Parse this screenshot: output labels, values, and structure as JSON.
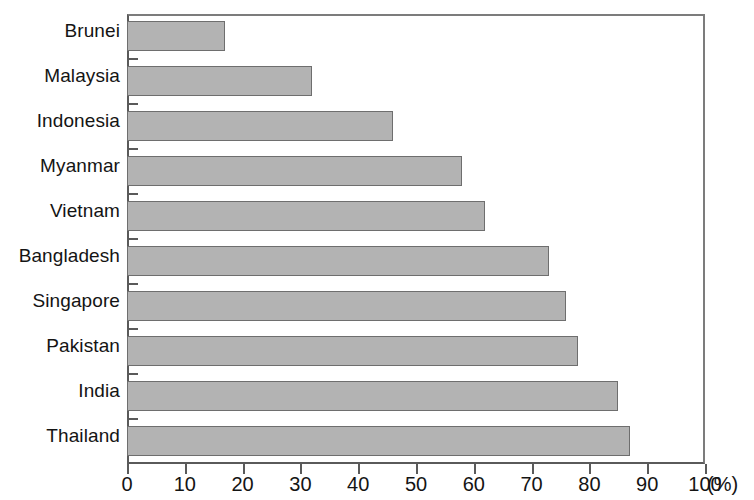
{
  "chart_data": {
    "type": "bar",
    "orientation": "horizontal",
    "title": "",
    "subtitle": "",
    "xlabel": "(%)",
    "ylabel": "",
    "categories": [
      "Brunei",
      "Malaysia",
      "Indonesia",
      "Myanmar",
      "Vietnam",
      "Bangladesh",
      "Singapore",
      "Pakistan",
      "India",
      "Thailand"
    ],
    "values": [
      17,
      32,
      46,
      58,
      62,
      73,
      76,
      78,
      85,
      87
    ],
    "series": [
      {
        "name": "",
        "values": [
          17,
          32,
          46,
          58,
          62,
          73,
          76,
          78,
          85,
          87
        ]
      }
    ],
    "xlim": [
      0,
      100
    ],
    "xticks": [
      0,
      10,
      20,
      30,
      40,
      50,
      60,
      70,
      80,
      90,
      100
    ],
    "xtick_labels": [
      "0",
      "10",
      "20",
      "30",
      "40",
      "50",
      "60",
      "70",
      "80",
      "90",
      "100"
    ],
    "x_unit_label": "(%)",
    "grid": false,
    "legend": null,
    "bar_fill_color": "#b3b3b3",
    "bar_border_color": "#6e6e6e",
    "axis_color": "#5a5a5a",
    "background_color": "#ffffff"
  },
  "axis": {
    "x_unit": "(%)"
  }
}
